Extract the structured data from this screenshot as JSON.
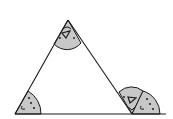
{
  "diagram": {
    "colors": {
      "line": "#1a1a1a",
      "sector_fill": "#c8c8c8",
      "background": "#ffffff"
    },
    "vertices": {
      "apex": [
        68,
        20
      ],
      "bottom_left": [
        15,
        114
      ],
      "bottom_right": [
        132,
        114
      ]
    },
    "base_line": {
      "x1": 15,
      "x2": 166,
      "y": 114
    },
    "angle_markers": [
      {
        "id": "apex-angle",
        "mark": "triangle"
      },
      {
        "id": "bottom-left-angle",
        "mark": "dots"
      },
      {
        "id": "bottom-right-angle",
        "mark": "triangle"
      },
      {
        "id": "exterior-angle-copy",
        "mark": "dots"
      }
    ]
  }
}
